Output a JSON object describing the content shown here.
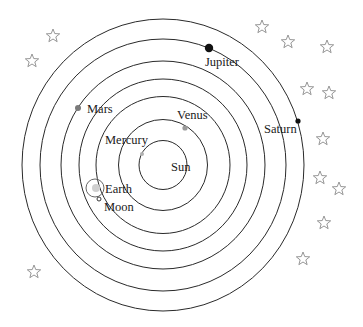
{
  "diagram": {
    "type": "heliocentric solar system",
    "center": {
      "x": 163,
      "y": 165
    },
    "colors": {
      "orbit": "#2a2a2a",
      "star": "#8a8a8a",
      "label": "#1a1a1a"
    },
    "sun": {
      "label": "Sun",
      "label_x": 171,
      "label_y": 171
    },
    "orbits": [
      {
        "name": "Mercury",
        "rx": 24,
        "ry": 24.5
      },
      {
        "name": "Venus",
        "rx": 44.5,
        "ry": 45.5
      },
      {
        "name": "Earth",
        "rx": 67,
        "ry": 68.5
      },
      {
        "name": "Mars",
        "rx": 84,
        "ry": 86
      },
      {
        "name": "Jupiter",
        "rx": 102,
        "ry": 104
      },
      {
        "name": "Saturn",
        "rx": 123,
        "ry": 126
      },
      {
        "name": "Outer",
        "rx": 141,
        "ry": 146
      }
    ],
    "planets": [
      {
        "name": "Mercury",
        "label": "Mercury",
        "x": 142,
        "y": 154,
        "r": 2,
        "color": "#b0b0b0",
        "label_x": 105,
        "label_y": 144
      },
      {
        "name": "Venus",
        "label": "Venus",
        "x": 185,
        "y": 128,
        "r": 2.6,
        "color": "#9a9a9a",
        "label_x": 177,
        "label_y": 119
      },
      {
        "name": "Earth",
        "label": "Earth",
        "x": 96,
        "y": 188,
        "r": 4,
        "color": "#cfcfcf",
        "label_x": 105,
        "label_y": 193
      },
      {
        "name": "Mars",
        "label": "Mars",
        "x": 78,
        "y": 108,
        "r": 3,
        "color": "#7a7a7a",
        "label_x": 87,
        "label_y": 113
      },
      {
        "name": "Jupiter",
        "label": "Jupiter",
        "x": 209,
        "y": 48,
        "r": 4.2,
        "color": "#111111",
        "label_x": 205,
        "label_y": 66
      },
      {
        "name": "Saturn",
        "label": "Saturn",
        "x": 298,
        "y": 121,
        "r": 2.6,
        "color": "#111111",
        "label_x": 264,
        "label_y": 133
      }
    ],
    "moon": {
      "label": "Moon",
      "orbit_cx": 95,
      "orbit_cy": 188,
      "orbit_r": 9,
      "x": 99,
      "y": 199,
      "r": 2,
      "label_x": 104,
      "label_y": 211
    },
    "stars": [
      {
        "x": 53,
        "y": 36
      },
      {
        "x": 32,
        "y": 61
      },
      {
        "x": 262,
        "y": 27
      },
      {
        "x": 288,
        "y": 42
      },
      {
        "x": 327,
        "y": 47
      },
      {
        "x": 307,
        "y": 89
      },
      {
        "x": 329,
        "y": 93
      },
      {
        "x": 323,
        "y": 139
      },
      {
        "x": 320,
        "y": 178
      },
      {
        "x": 339,
        "y": 189
      },
      {
        "x": 324,
        "y": 223
      },
      {
        "x": 303,
        "y": 259
      },
      {
        "x": 34,
        "y": 272
      }
    ]
  }
}
